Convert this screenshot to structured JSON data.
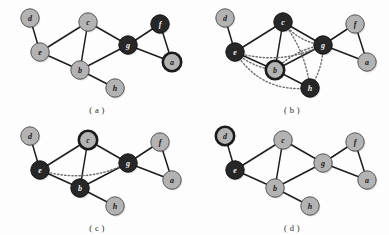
{
  "figure": {
    "width": 389,
    "height": 235,
    "background": "#fdfdfd"
  },
  "styles": {
    "light_fill": "#b3b3b3",
    "dark_fill": "#272727",
    "light_stroke": "#555555",
    "dark_stroke": "#111111",
    "ring_stroke": "#1a1a1a",
    "edge_color": "#1d1d1d",
    "dotted_color": "#6e6e6e",
    "light_label_color": "#1a1a1a",
    "dark_label_color": "#f2f2f2",
    "node_radius": 9.2,
    "edge_width": 1.5,
    "dotted_width": 1.4,
    "ring_width": 2.6,
    "normal_width": 1.0
  },
  "node_positions": {
    "d": [
      30,
      18
    ],
    "e": [
      40,
      52
    ],
    "c": [
      88,
      22
    ],
    "b": [
      80,
      70
    ],
    "h": [
      115,
      88
    ],
    "g": [
      128,
      45
    ],
    "f": [
      160,
      24
    ],
    "a": [
      172,
      62
    ]
  },
  "base_edges": [
    [
      "d",
      "e"
    ],
    [
      "e",
      "c"
    ],
    [
      "e",
      "b"
    ],
    [
      "c",
      "b"
    ],
    [
      "c",
      "g"
    ],
    [
      "b",
      "h"
    ],
    [
      "b",
      "g"
    ],
    [
      "g",
      "f"
    ],
    [
      "g",
      "a"
    ],
    [
      "f",
      "a"
    ]
  ],
  "panels": [
    {
      "id": "panel-a",
      "caption": "( a )",
      "x": 0,
      "y": 0,
      "dark_nodes": [
        "g",
        "f"
      ],
      "ring_nodes": [
        "a"
      ],
      "dotted_edges": []
    },
    {
      "id": "panel-b",
      "caption": "( b )",
      "x": 195,
      "y": 0,
      "dark_nodes": [
        "e",
        "c",
        "g",
        "h"
      ],
      "ring_nodes": [
        "b"
      ],
      "dotted_edges": [
        [
          "e",
          "g"
        ],
        [
          "e",
          "h"
        ],
        [
          "c",
          "h"
        ],
        [
          "c",
          "g"
        ],
        [
          "b",
          "g"
        ],
        [
          "g",
          "h"
        ],
        [
          "e",
          "b"
        ]
      ]
    },
    {
      "id": "panel-c",
      "caption": "( c )",
      "x": 0,
      "y": 118,
      "dark_nodes": [
        "e",
        "b",
        "g"
      ],
      "ring_nodes": [
        "c"
      ],
      "dotted_edges": [
        [
          "e",
          "g"
        ]
      ]
    },
    {
      "id": "panel-d",
      "caption": "( d )",
      "x": 195,
      "y": 118,
      "dark_nodes": [
        "e"
      ],
      "ring_nodes": [
        "d"
      ],
      "dotted_edges": []
    }
  ],
  "node_labels": {
    "a": "a",
    "b": "b",
    "c": "c",
    "d": "d",
    "e": "e",
    "f": "f",
    "g": "g",
    "h": "h"
  }
}
